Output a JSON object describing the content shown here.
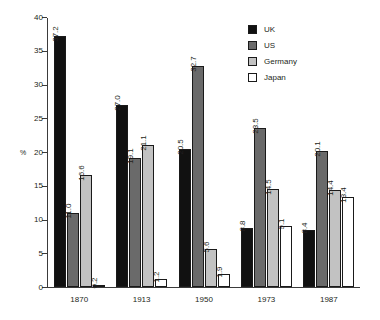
{
  "chart_data": {
    "type": "bar",
    "title": "",
    "xlabel": "",
    "ylabel": "%",
    "ylim": [
      0,
      40
    ],
    "yticks": [
      0,
      5,
      10,
      15,
      20,
      25,
      30,
      35,
      40
    ],
    "grid": false,
    "legend_position": "top-right",
    "categories": [
      "1870",
      "1913",
      "1950",
      "1973",
      "1987"
    ],
    "series": [
      {
        "name": "UK",
        "color": "#111111",
        "values": [
          37.2,
          27.0,
          20.5,
          8.8,
          8.4
        ],
        "labels": [
          "37.2",
          "27.0",
          "20.5",
          "8.8",
          "8.4"
        ]
      },
      {
        "name": "US",
        "color": "#6a6a6a",
        "values": [
          11.0,
          19.1,
          32.7,
          23.5,
          20.1
        ],
        "labels": [
          "11.0",
          "19.1",
          "32.7",
          "23.5",
          "20.1"
        ]
      },
      {
        "name": "Germany",
        "color": "#c2c2c2",
        "values": [
          16.6,
          21.1,
          5.6,
          14.5,
          14.4
        ],
        "labels": [
          "16.6",
          "21.1",
          "5.6",
          "14.5",
          "14.4"
        ]
      },
      {
        "name": "Japan",
        "color": "#ffffff",
        "values": [
          0.2,
          1.2,
          1.9,
          9.1,
          13.4
        ],
        "labels": [
          "0.2",
          "1.2",
          "1.9",
          "9.1",
          "13.4"
        ]
      }
    ]
  }
}
